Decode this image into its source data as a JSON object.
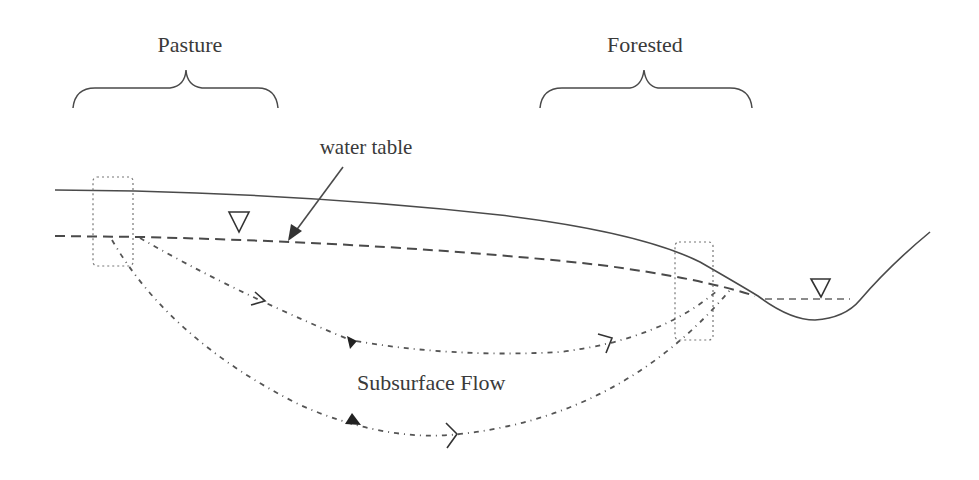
{
  "diagram": {
    "type": "hydrology cross-section",
    "labels": {
      "pasture": "Pasture",
      "forested": "Forested",
      "water_table": "water table",
      "subsurface_flow": "Subsurface Flow"
    },
    "elements": [
      "ground-surface-line",
      "water-table-dashed-line",
      "stream-channel",
      "stream-water-level",
      "water-level-triangle-pasture",
      "water-level-triangle-stream",
      "pasture-sampling-box",
      "forested-sampling-box",
      "shallow-flow-path",
      "deep-flow-path",
      "water-table-arrow"
    ],
    "colors": {
      "line": "#4a4a4a",
      "text": "#3a3a3a",
      "background": "#ffffff"
    }
  }
}
